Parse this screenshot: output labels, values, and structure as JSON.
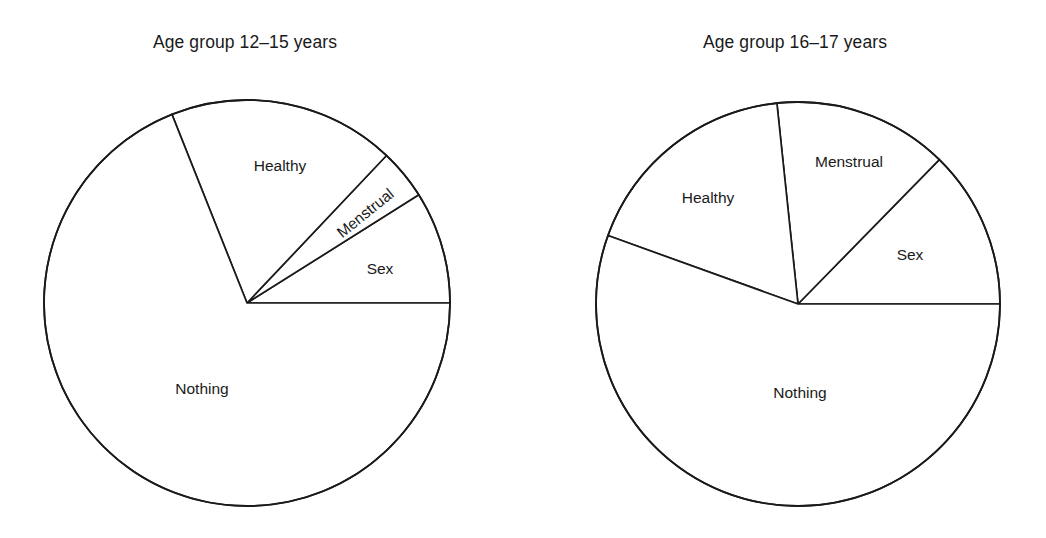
{
  "figure": {
    "background_color": "#ffffff",
    "line_color": "#1a1a1a",
    "slice_fill_color": "#ffffff"
  },
  "chart_data": [
    {
      "type": "pie",
      "title": "Age group 12–15 years",
      "xlabel": "",
      "ylabel": "",
      "legend": "none",
      "grid": false,
      "start_angle_deg": 0,
      "direction": "counterclockwise",
      "categories": [
        "Sex",
        "Menstrual",
        "Healthy",
        "Nothing"
      ],
      "values": [
        8.9,
        4.0,
        18.1,
        68.9
      ],
      "slices": [
        {
          "label": "Sex",
          "value": 8.9,
          "start_deg": 0.0,
          "end_deg": 32.2
        },
        {
          "label": "Menstrual",
          "value": 4.0,
          "start_deg": 32.2,
          "end_deg": 46.6
        },
        {
          "label": "Healthy",
          "value": 18.1,
          "start_deg": 46.6,
          "end_deg": 111.7
        },
        {
          "label": "Nothing",
          "value": 68.9,
          "start_deg": 111.7,
          "end_deg": 360.0
        }
      ],
      "geometry": {
        "cx": 247,
        "cy": 303,
        "r": 203
      },
      "label_positions": [
        {
          "label": "Sex",
          "x": 380,
          "y": 270,
          "rotate": 0
        },
        {
          "label": "Menstrual",
          "x": 366,
          "y": 214,
          "rotate": -39
        },
        {
          "label": "Healthy",
          "x": 280,
          "y": 167,
          "rotate": 0
        },
        {
          "label": "Nothing",
          "x": 202,
          "y": 390,
          "rotate": 0
        }
      ],
      "title_position": {
        "x": 245,
        "y": 48
      }
    },
    {
      "type": "pie",
      "title": "Age group 16–17 years",
      "xlabel": "",
      "ylabel": "",
      "legend": "none",
      "grid": false,
      "start_angle_deg": 0,
      "direction": "counterclockwise",
      "categories": [
        "Sex",
        "Menstrual",
        "Healthy",
        "Nothing"
      ],
      "values": [
        12.7,
        14.0,
        17.8,
        55.5
      ],
      "slices": [
        {
          "label": "Sex",
          "value": 12.7,
          "start_deg": 0.0,
          "end_deg": 45.6
        },
        {
          "label": "Menstrual",
          "value": 14.0,
          "start_deg": 45.6,
          "end_deg": 96.0
        },
        {
          "label": "Healthy",
          "value": 17.8,
          "start_deg": 96.0,
          "end_deg": 160.2
        },
        {
          "label": "Nothing",
          "value": 55.5,
          "start_deg": 160.2,
          "end_deg": 360.0
        }
      ],
      "geometry": {
        "cx": 798,
        "cy": 304,
        "r": 202
      },
      "label_positions": [
        {
          "label": "Sex",
          "x": 910,
          "y": 256,
          "rotate": 0
        },
        {
          "label": "Menstrual",
          "x": 849,
          "y": 163,
          "rotate": 0
        },
        {
          "label": "Healthy",
          "x": 708,
          "y": 199,
          "rotate": 0
        },
        {
          "label": "Nothing",
          "x": 800,
          "y": 394,
          "rotate": 0
        }
      ],
      "title_position": {
        "x": 795,
        "y": 48
      }
    }
  ]
}
